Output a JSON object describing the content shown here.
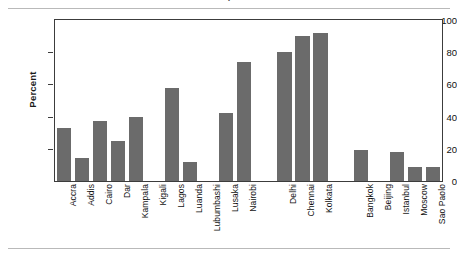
{
  "figure": {
    "title": "Access to Improved Water",
    "title_clipped": true
  },
  "chart_data": {
    "type": "bar",
    "title": "Access to Improved Water",
    "xlabel": "",
    "ylabel": "Percent",
    "ylim": [
      0,
      100
    ],
    "ytick_values": [
      0,
      20,
      40,
      60,
      80,
      100
    ],
    "ytick_labels": [
      "0",
      "20",
      "40",
      "60",
      "80",
      "100"
    ],
    "grid": false,
    "legend": "none",
    "bar_color": "#6b6b6b",
    "frame_color": "#3c3c3c",
    "categories": [
      "Accra",
      "Addis",
      "Cairo",
      "Dar",
      "Kampala",
      "Kigali",
      "Lagos",
      "Luanda",
      "Lubumbashi",
      "Lusaka",
      "Nairobi",
      "Delhi",
      "Chennai",
      "Kolkata",
      "Bangkok",
      "Beijing",
      "Istanbul",
      "Moscow",
      "Sao Paolo"
    ],
    "values": [
      33,
      14,
      37,
      25,
      40,
      0,
      58,
      12,
      0,
      42,
      74,
      80,
      90,
      92,
      19,
      0,
      18,
      9,
      9
    ],
    "groups": [
      {
        "name": "Africa",
        "start_index": 0,
        "end_index": 10
      },
      {
        "name": "India",
        "start_index": 11,
        "end_index": 13
      },
      {
        "name": "Other",
        "start_index": 14,
        "end_index": 18
      }
    ]
  }
}
